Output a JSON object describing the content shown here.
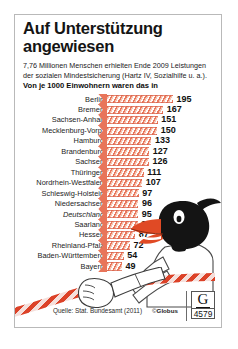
{
  "headline": {
    "title": "Auf Unterstützung angewiesen",
    "subtitle": "7,76 Millionen Menschen erhielten Ende 2009 Leistungen der sozialen Mindestsicherung (Hartz IV, Sozialhilfe u. a.).",
    "subtitle_bold": "Von je 1000 Einwohnern waren das in"
  },
  "chart_data": {
    "type": "bar",
    "title": "Auf Unterstützung angewiesen",
    "subtitle": "Von je 1000 Einwohnern waren das in",
    "xlabel": "Empfänger je 1000 Einwohner",
    "ylabel": "",
    "orientation": "horizontal",
    "grid": false,
    "legend": false,
    "xlim": [
      0,
      195
    ],
    "unit": "je 1000 Einwohner",
    "categories": [
      "Berlin",
      "Bremen",
      "Sachsen-Anhalt",
      "Mecklenburg-Vorp.",
      "Hamburg",
      "Brandenburg",
      "Sachsen",
      "Thüringen",
      "Nordrhein-Westfalen",
      "Schleswig-Holstein",
      "Niedersachsen",
      "Deutschland",
      "Saarland",
      "Hessen",
      "Rheinland-Pfalz",
      "Baden-Württemberg",
      "Bayern"
    ],
    "values": [
      195,
      167,
      151,
      150,
      133,
      127,
      126,
      111,
      107,
      97,
      96,
      95,
      94,
      87,
      72,
      54,
      49
    ],
    "highlight_category": "Deutschland",
    "bar_color": "#e8755a"
  },
  "footer": {
    "source": "Quelle: Stat. Bundesamt (2011)",
    "copyright_mark": "©",
    "copyright_name": "Globus",
    "logo_letter": "G",
    "logo_number": "4579"
  }
}
